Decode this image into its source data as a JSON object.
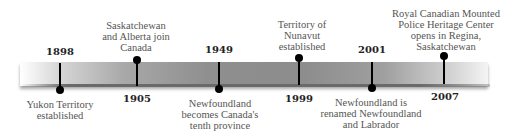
{
  "timeline": {
    "events": [
      {
        "year": "1898",
        "label": "Yukon Territory\nestablished",
        "position": "below-label"
      },
      {
        "year": "1905",
        "label": "Saskatchewan\nand Alberta join\nCanada",
        "position": "above-label"
      },
      {
        "year": "1949",
        "label": "Newfoundland\nbecomes Canada's\ntenth province",
        "position": "below-label"
      },
      {
        "year": "1999",
        "label": "Territory of\nNunavut\nestablished",
        "position": "above-label"
      },
      {
        "year": "2001",
        "label": "Newfoundland is\nrenamed Newfoundland\nand Labrador",
        "position": "below-label"
      },
      {
        "year": "2007",
        "label": "Royal Canadian Mounted\nPolice Heritage Center\nopens in Regina,\nSaskatchewan",
        "position": "above-label"
      }
    ]
  },
  "colors": {
    "bar_dark": "#8c8c8c",
    "marker": "#000000",
    "year_text": "#222222",
    "label_text": "#555555"
  }
}
